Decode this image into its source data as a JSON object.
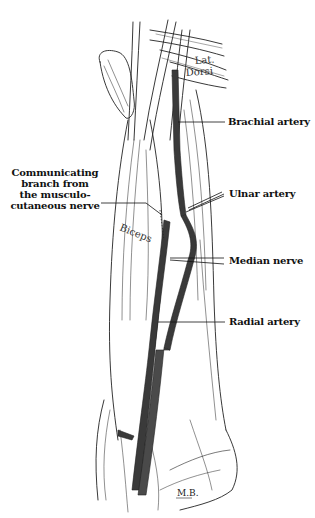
{
  "figure": {
    "type": "anatomical illustration",
    "signature": "M.B.",
    "colors": {
      "vessel": "#3a3a3a",
      "line": "#222222",
      "background": "#ffffff"
    }
  },
  "muscle_labels": {
    "lat_dorsi_line1": "Lat.",
    "lat_dorsi_line2": "Dorsi",
    "biceps": "Biceps"
  },
  "callouts": {
    "brachial_artery": "Brachial artery",
    "ulnar_artery": "Ulnar artery",
    "median_nerve": "Median nerve",
    "radial_artery": "Radial artery",
    "communicating_branch": {
      "line1": "Communicating",
      "line2": "branch from",
      "line3": "the musculo-",
      "line4": "cutaneous nerve"
    }
  }
}
